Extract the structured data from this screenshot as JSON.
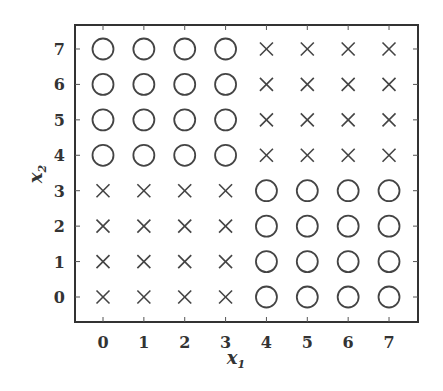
{
  "chart_data": {
    "type": "scatter",
    "title": "",
    "xlabel": "x1",
    "ylabel": "x2",
    "xlim": [
      -0.7,
      7.7
    ],
    "ylim": [
      -0.7,
      7.7
    ],
    "xticks": [
      0,
      1,
      2,
      3,
      4,
      5,
      6,
      7
    ],
    "yticks": [
      0,
      1,
      2,
      3,
      4,
      5,
      6,
      7
    ],
    "grid": false,
    "legend": null,
    "marker_color": "#444444",
    "series": [
      {
        "name": "circle",
        "marker": "o",
        "points": [
          [
            0,
            4
          ],
          [
            1,
            4
          ],
          [
            2,
            4
          ],
          [
            3,
            4
          ],
          [
            0,
            5
          ],
          [
            1,
            5
          ],
          [
            2,
            5
          ],
          [
            3,
            5
          ],
          [
            0,
            6
          ],
          [
            1,
            6
          ],
          [
            2,
            6
          ],
          [
            3,
            6
          ],
          [
            0,
            7
          ],
          [
            1,
            7
          ],
          [
            2,
            7
          ],
          [
            3,
            7
          ],
          [
            4,
            0
          ],
          [
            5,
            0
          ],
          [
            6,
            0
          ],
          [
            7,
            0
          ],
          [
            4,
            1
          ],
          [
            5,
            1
          ],
          [
            6,
            1
          ],
          [
            7,
            1
          ],
          [
            4,
            2
          ],
          [
            5,
            2
          ],
          [
            6,
            2
          ],
          [
            7,
            2
          ],
          [
            4,
            3
          ],
          [
            5,
            3
          ],
          [
            6,
            3
          ],
          [
            7,
            3
          ]
        ]
      },
      {
        "name": "cross",
        "marker": "x",
        "points": [
          [
            0,
            0
          ],
          [
            1,
            0
          ],
          [
            2,
            0
          ],
          [
            3,
            0
          ],
          [
            0,
            1
          ],
          [
            1,
            1
          ],
          [
            2,
            1
          ],
          [
            3,
            1
          ],
          [
            0,
            2
          ],
          [
            1,
            2
          ],
          [
            2,
            2
          ],
          [
            3,
            2
          ],
          [
            0,
            3
          ],
          [
            1,
            3
          ],
          [
            2,
            3
          ],
          [
            3,
            3
          ],
          [
            4,
            4
          ],
          [
            5,
            4
          ],
          [
            6,
            4
          ],
          [
            7,
            4
          ],
          [
            4,
            5
          ],
          [
            5,
            5
          ],
          [
            6,
            5
          ],
          [
            7,
            5
          ],
          [
            4,
            6
          ],
          [
            5,
            6
          ],
          [
            6,
            6
          ],
          [
            7,
            6
          ],
          [
            4,
            7
          ],
          [
            5,
            7
          ],
          [
            6,
            7
          ],
          [
            7,
            7
          ]
        ]
      }
    ]
  },
  "labels": {
    "xlabel_main": "x",
    "xlabel_sub": "1",
    "ylabel_main": "x",
    "ylabel_sub": "2"
  }
}
